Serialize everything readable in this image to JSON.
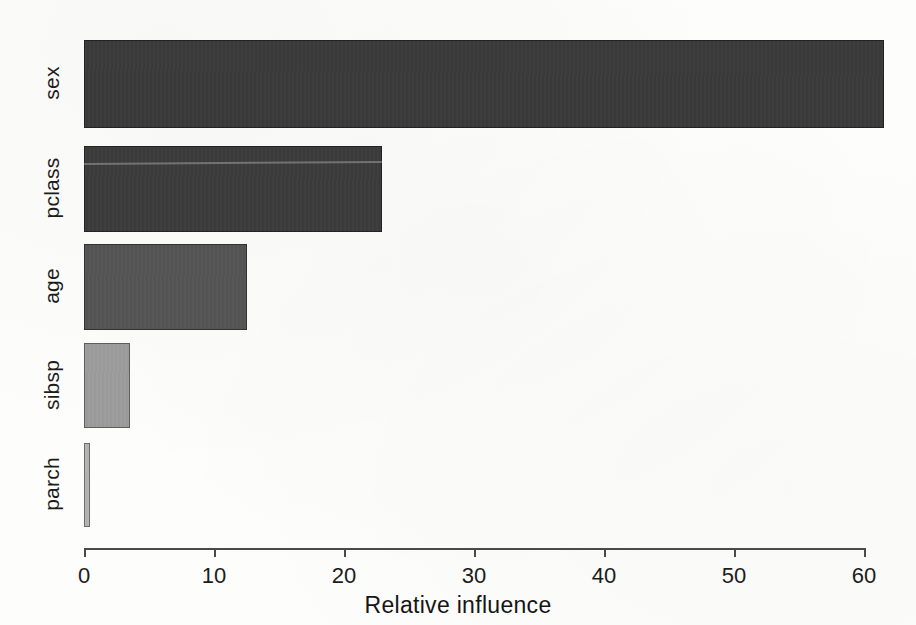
{
  "chart_data": {
    "type": "bar",
    "orientation": "horizontal",
    "title": "",
    "subtitle": "",
    "xlabel": "Relative influence",
    "ylabel": "",
    "categories": [
      "sex",
      "pclass",
      "age",
      "sibsp",
      "parch"
    ],
    "values": [
      61.5,
      22.9,
      12.5,
      3.5,
      0.45
    ],
    "series": [
      {
        "name": "Relative influence",
        "values": [
          61.5,
          22.9,
          12.5,
          3.5,
          0.45
        ]
      }
    ],
    "bar_colors": [
      "#3a3a3a",
      "#3b3b3b",
      "#545454",
      "#9c9c9c",
      "#b4b4b4"
    ],
    "xlim": [
      0,
      60
    ],
    "xticks": [
      0,
      10,
      20,
      30,
      40,
      50,
      60
    ],
    "xtick_labels": [
      "0",
      "10",
      "20",
      "30",
      "40",
      "50",
      "60"
    ],
    "grid": false,
    "legend": false,
    "legend_position": "none"
  },
  "axis": {
    "x_title": "Relative influence",
    "tick_labels": [
      "0",
      "10",
      "20",
      "30",
      "40",
      "50",
      "60"
    ]
  },
  "categories": {
    "labels": [
      "sex",
      "pclass",
      "age",
      "sibsp",
      "parch"
    ]
  },
  "colors": {
    "background": "#fdfdfb",
    "axis": "#4a4a4a",
    "text": "#1c1c1c",
    "bar_darkest": "#3a3a3a",
    "bar_lightest": "#b4b4b4"
  }
}
